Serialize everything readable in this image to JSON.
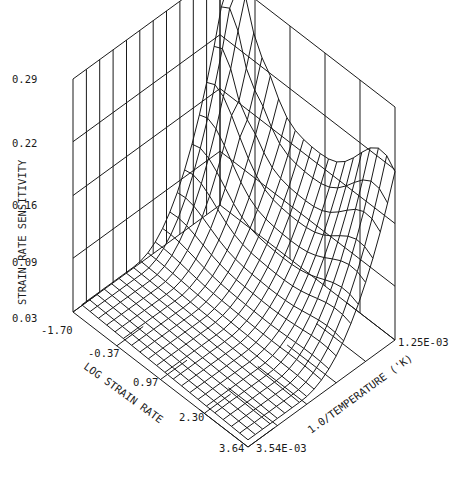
{
  "chart_data": {
    "type": "surface3d",
    "title": "",
    "zlabel": "STRAIN RATE SENSITIVITY",
    "xlabel": "LOG STRAIN RATE",
    "ylabel": "1.0/TEMPERATURE ('K)",
    "z_ticks": [
      "0.03",
      "0.09",
      "0.16",
      "0.22",
      "0.29"
    ],
    "z_tick_values": [
      0.03,
      0.09,
      0.16,
      0.22,
      0.29
    ],
    "x_ticks": [
      "-1.70",
      "-0.37",
      "0.97",
      "2.30",
      "3.64"
    ],
    "x_tick_values": [
      -1.7,
      -0.37,
      0.97,
      2.3,
      3.64
    ],
    "y_ticks": [
      "3.54E-03",
      "1.25E-03"
    ],
    "y_tick_values": [
      0.00354,
      0.00125
    ],
    "zlim": [
      0.03,
      0.29
    ],
    "xlim": [
      -1.7,
      3.64
    ],
    "ylim": [
      0.00125,
      0.00354
    ],
    "grid": true,
    "grid_note": "surface mesh 21 x 21 over log strain rate x 1/T; z estimated from projected wireframe",
    "x_grid": [
      -1.7,
      -1.43,
      -1.17,
      -0.9,
      -0.63,
      -0.37,
      -0.1,
      0.17,
      0.44,
      0.7,
      0.97,
      1.24,
      1.5,
      1.77,
      2.04,
      2.3,
      2.57,
      2.84,
      3.1,
      3.37,
      3.64
    ],
    "y_grid_fraction_from_back": [
      0.0,
      0.05,
      0.1,
      0.15,
      0.2,
      0.25,
      0.3,
      0.35,
      0.4,
      0.45,
      0.5,
      0.55,
      0.6,
      0.65,
      0.7,
      0.75,
      0.8,
      0.85,
      0.9,
      0.95,
      1.0
    ],
    "surface_profile": {
      "back_edge_peak": {
        "log_strain_rate": -1.3,
        "value": 0.275
      },
      "secondary_peak": {
        "log_strain_rate": -0.9,
        "value": 0.24
      },
      "right_ridge": {
        "log_strain_rate": 3.4,
        "value": 0.21
      },
      "front_plateau_value": 0.04,
      "left_plateau_value": 0.045
    }
  },
  "axes": {
    "z_tick_labels": [
      "0.03",
      "0.09",
      "0.16",
      "0.22",
      "0.29"
    ],
    "x_tick_labels": [
      "-1.70",
      "-0.37",
      "0.97",
      "2.30",
      "3.64"
    ],
    "y_tick_labels": [
      "3.54E-03",
      "1.25E-03"
    ],
    "z_title": "STRAIN RATE SENSITIVITY",
    "x_title": "LOG STRAIN RATE",
    "y_title": "1.0/TEMPERATURE ('K)"
  },
  "colors": {
    "line": "#1a1a1a",
    "background": "#ffffff"
  }
}
